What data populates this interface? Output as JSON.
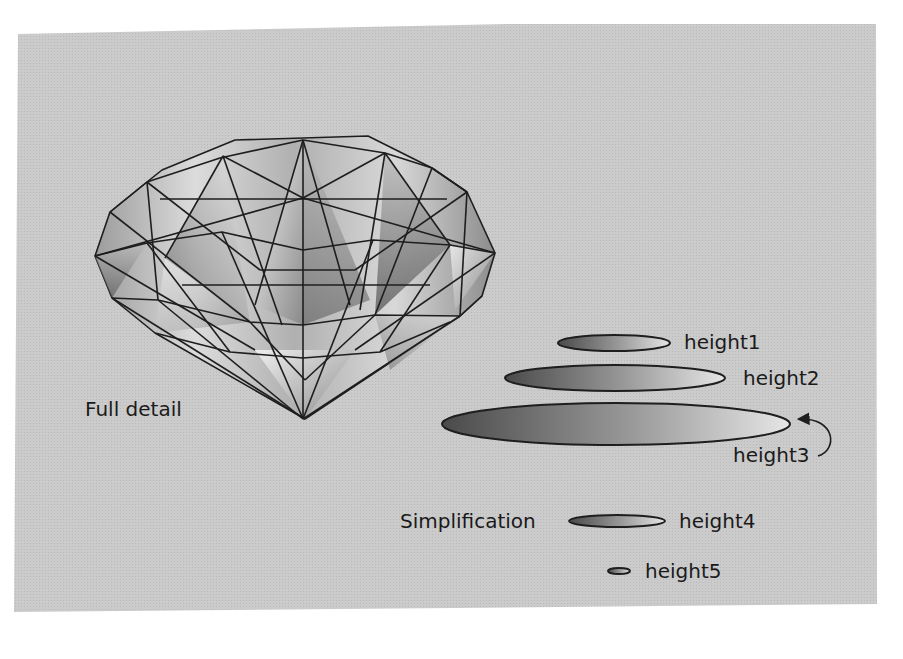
{
  "figure": {
    "background_color": "#c9c9c9",
    "line_color": "#1e1e1e",
    "full_detail_label": "Full detail",
    "simplification_label": "Simplification",
    "ellipses": [
      {
        "label": "height1"
      },
      {
        "label": "height2"
      },
      {
        "label": "height3"
      },
      {
        "label": "height4"
      },
      {
        "label": "height5"
      }
    ]
  }
}
